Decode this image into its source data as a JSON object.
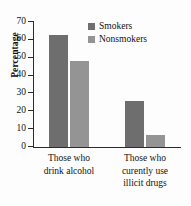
{
  "chart_data": {
    "type": "bar",
    "title": "",
    "xlabel": "",
    "ylabel": "Percentage",
    "ylim": [
      0,
      70
    ],
    "ytick_step": 10,
    "yticks": [
      70,
      60,
      50,
      40,
      30,
      20,
      10,
      0
    ],
    "ytick_labels": [
      "70",
      "60",
      "50",
      "40",
      "30",
      "20",
      "10",
      "0"
    ],
    "grid": false,
    "legend_position": "top-right-inside",
    "categories": [
      "Those who drink alcohol",
      "Those who curently use illicit drugs"
    ],
    "category_lines": [
      [
        "Those who",
        "drink alcohol"
      ],
      [
        "Those who",
        "curently use",
        "illicit drugs"
      ]
    ],
    "series": [
      {
        "name": "Smokers",
        "color": "#6e6e6e",
        "values": [
          63,
          26
        ]
      },
      {
        "name": "Nonsmokers",
        "color": "#949494",
        "values": [
          48,
          6.5
        ]
      }
    ],
    "axis_color": "#2b2b2b",
    "background": "#fdfdfd"
  }
}
